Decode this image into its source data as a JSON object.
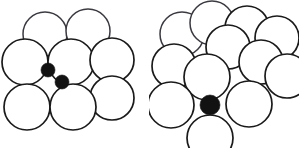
{
  "figure": {
    "title": "",
    "background_color": "#ffffff",
    "width": 299,
    "height": 148,
    "sphere_fill": "#ffffff",
    "sphere_stroke": "#1a1a1a",
    "hole_fill": "#121212"
  },
  "panels": [
    {
      "id": "left",
      "name": "square-packing-with-tetrahedral-holes",
      "label": "",
      "large_sphere_count": 8,
      "small_sphere_count": 2,
      "large_sphere_radius": 22,
      "small_sphere_radius": 7,
      "large_spheres": [
        {
          "cx": 45,
          "cy": 34,
          "r": 22,
          "clip": "none"
        },
        {
          "cx": 88,
          "cy": 31,
          "r": 22,
          "clip": "none"
        },
        {
          "cx": 25,
          "cy": 62,
          "r": 23,
          "clip": "none"
        },
        {
          "cx": 71,
          "cy": 62,
          "r": 23,
          "clip": "none"
        },
        {
          "cx": 112,
          "cy": 60,
          "r": 22,
          "clip": "none"
        },
        {
          "cx": 112,
          "cy": 98,
          "r": 22,
          "clip": "none"
        },
        {
          "cx": 27,
          "cy": 107,
          "r": 23,
          "clip": "none"
        },
        {
          "cx": 73,
          "cy": 107,
          "r": 23,
          "clip": "none"
        }
      ],
      "small_spheres": [
        {
          "cx": 48,
          "cy": 70,
          "r": 7
        },
        {
          "cx": 62,
          "cy": 82,
          "r": 7
        }
      ]
    },
    {
      "id": "right",
      "name": "close-packing-with-octahedral-hole",
      "label": "",
      "large_sphere_count": 12,
      "small_sphere_count": 1,
      "large_sphere_radius": 22,
      "small_sphere_radius": 10,
      "large_spheres": [
        {
          "cx": 33,
          "cy": 34,
          "r": 22,
          "clip": "none"
        },
        {
          "cx": 63,
          "cy": 23,
          "r": 22,
          "clip": "none"
        },
        {
          "cx": 98,
          "cy": 28,
          "r": 22,
          "clip": "none"
        },
        {
          "cx": 128,
          "cy": 38,
          "r": 22,
          "clip": "right-edge"
        },
        {
          "cx": 79,
          "cy": 47,
          "r": 22,
          "clip": "none"
        },
        {
          "cx": 112,
          "cy": 62,
          "r": 22,
          "clip": "none"
        },
        {
          "cx": 138,
          "cy": 76,
          "r": 22,
          "clip": "right-edge"
        },
        {
          "cx": 25,
          "cy": 66,
          "r": 22,
          "clip": "none"
        },
        {
          "cx": 58,
          "cy": 77,
          "r": 23,
          "clip": "none"
        },
        {
          "cx": 22,
          "cy": 105,
          "r": 23,
          "clip": "none"
        },
        {
          "cx": 100,
          "cy": 104,
          "r": 23,
          "clip": "none"
        },
        {
          "cx": 61,
          "cy": 138,
          "r": 23,
          "clip": "bottom-edge"
        }
      ],
      "small_spheres": [
        {
          "cx": 61,
          "cy": 105,
          "r": 10
        }
      ]
    }
  ],
  "legend": {
    "items": [
      {
        "name": "large-sphere",
        "description": ""
      },
      {
        "name": "interstitial-sphere",
        "description": ""
      }
    ]
  }
}
